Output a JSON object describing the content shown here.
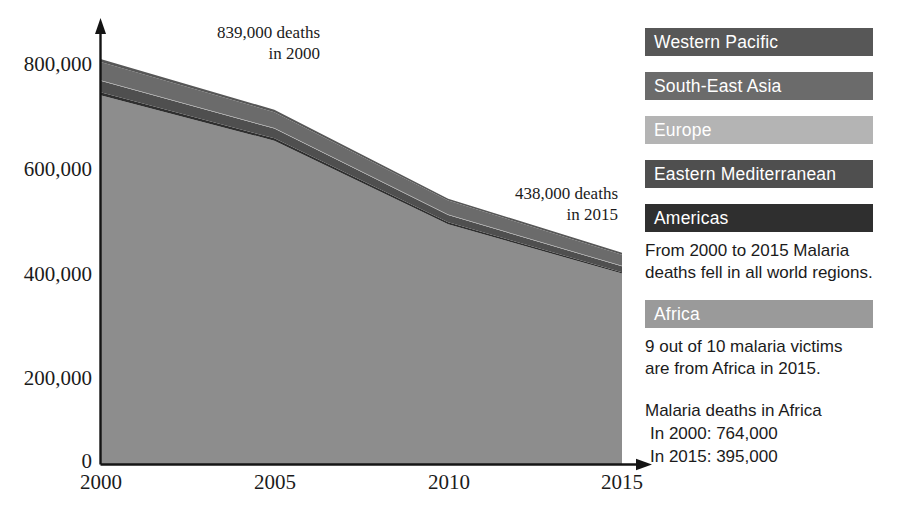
{
  "chart_data": {
    "type": "area",
    "title": "",
    "subtitle": "",
    "xlabel": "",
    "ylabel": "",
    "stacked": true,
    "grid": false,
    "legend_position": "right",
    "x": [
      2000,
      2005,
      2010,
      2015
    ],
    "xlim": [
      2000,
      2015
    ],
    "ylim": [
      0,
      900000
    ],
    "xtick_labels": [
      "2000",
      "2005",
      "2010",
      "2015"
    ],
    "ytick_labels": [
      "0",
      "200,000",
      "400,000",
      "600,000",
      "800,000"
    ],
    "ytick_values": [
      0,
      200000,
      400000,
      600000,
      800000
    ],
    "series": [
      {
        "name": "Africa",
        "color": "#8d8d8d",
        "values": [
          764000,
          670000,
          497000,
          395000
        ]
      },
      {
        "name": "Americas",
        "color": "#2f2f2f",
        "values": [
          6000,
          5000,
          4000,
          3000
        ]
      },
      {
        "name": "Eastern Mediterranean",
        "color": "#4f4f4f",
        "values": [
          24000,
          20000,
          15000,
          12000
        ]
      },
      {
        "name": "Europe",
        "color": "#b4b4b4",
        "values": [
          1000,
          1000,
          1000,
          1000
        ]
      },
      {
        "name": "South-East Asia",
        "color": "#6b6b6b",
        "values": [
          38000,
          33000,
          29000,
          23000
        ]
      },
      {
        "name": "Western Pacific",
        "color": "#575757",
        "values": [
          6000,
          5000,
          4000,
          4000
        ]
      }
    ],
    "totals": [
      839000,
      734000,
      550000,
      438000
    ],
    "annotations": [
      {
        "id": "start-total",
        "text": "839,000 deaths\nin 2000",
        "x": 2000,
        "y": 839000
      },
      {
        "id": "end-total",
        "text": "438,000 deaths\nin 2015",
        "x": 2015,
        "y": 438000
      }
    ]
  },
  "axis": {
    "y_ticks": [
      {
        "label": "800,000"
      },
      {
        "label": "600,000"
      },
      {
        "label": "400,000"
      },
      {
        "label": "200,000"
      },
      {
        "label": "0"
      }
    ],
    "x_ticks": [
      {
        "label": "2000"
      },
      {
        "label": "2005"
      },
      {
        "label": "2010"
      },
      {
        "label": "2015"
      }
    ]
  },
  "annotations": {
    "start": "839,000 deaths\nin 2000",
    "end": "438,000 deaths\nin 2015"
  },
  "legend": {
    "items": [
      {
        "label": "Western Pacific",
        "color": "#575757"
      },
      {
        "label": "South-East Asia",
        "color": "#6b6b6b"
      },
      {
        "label": "Europe",
        "color": "#b4b4b4"
      },
      {
        "label": "Eastern Mediterranean",
        "color": "#4f4f4f"
      },
      {
        "label": "Americas",
        "color": "#2f2f2f"
      },
      {
        "label": "Africa",
        "color": "#9a9a9a"
      }
    ]
  },
  "notes": {
    "world": "From 2000 to 2015 Malaria\ndeaths fell in all world regions.",
    "africa_share": "9 out of 10 malaria victims\nare from Africa in 2015.",
    "africa_deaths_title": "Malaria deaths in Africa",
    "africa_2000": "In 2000: 764,000",
    "africa_2015": "In 2015: 395,000"
  },
  "colors": {
    "axis": "#141414",
    "text": "#1b1b1b",
    "background": "#ffffff"
  }
}
